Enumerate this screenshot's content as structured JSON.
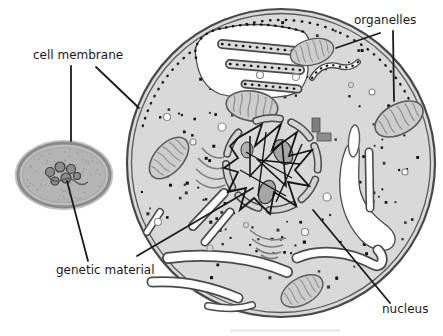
{
  "figure": {
    "type": "cell-comparison-diagram",
    "labels": {
      "cell_membrane": "cell membrane",
      "organelles": "organelles",
      "genetic_material": "genetic material",
      "nucleus": "nucleus"
    },
    "colors": {
      "background": "#ffffff",
      "label_text": "#1a1a1a",
      "leader_line": "#1b1b1b",
      "cytoplasm": "#d9d9d9",
      "membrane": "#484848",
      "organelle_fill": "#cdcdcd",
      "organelle_detail": "#8f8f8f",
      "ribosome_dot": "#141414",
      "er_lumen": "#ffffff",
      "nucleolus": "#a6a6a6",
      "chromatin": "#141414",
      "prokaryote_fill": "#bdbdbd",
      "prokaryote_membrane": "#8a8a8a",
      "nucleoid": "#8d8d8d"
    },
    "ribosomes": {
      "count": 130
    },
    "speckle": {
      "count": 70
    }
  }
}
